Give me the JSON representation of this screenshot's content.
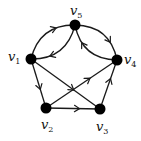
{
  "diagram": {
    "type": "directed-graph",
    "nodes": [
      {
        "id": "v1",
        "label": "v",
        "sub": "1",
        "x": 31,
        "y": 59,
        "lx": 8,
        "ly": 50
      },
      {
        "id": "v2",
        "label": "v",
        "sub": "2",
        "x": 46,
        "y": 108,
        "lx": 41,
        "ly": 118
      },
      {
        "id": "v3",
        "label": "v",
        "sub": "3",
        "x": 100,
        "y": 109,
        "lx": 96,
        "ly": 120
      },
      {
        "id": "v4",
        "label": "v",
        "sub": "4",
        "x": 117,
        "y": 60,
        "lx": 124,
        "ly": 53
      },
      {
        "id": "v5",
        "label": "v",
        "sub": "5",
        "x": 75,
        "y": 25,
        "lx": 70,
        "ly": 4
      }
    ],
    "edges": [
      {
        "from": "v1",
        "to": "v5",
        "curve": "upper"
      },
      {
        "from": "v5",
        "to": "v1",
        "curve": "lower"
      },
      {
        "from": "v5",
        "to": "v4",
        "curve": "upper"
      },
      {
        "from": "v4",
        "to": "v5",
        "curve": "lower"
      },
      {
        "from": "v1",
        "to": "v2",
        "curve": "straight"
      },
      {
        "from": "v1",
        "to": "v3",
        "curve": "straight"
      },
      {
        "from": "v2",
        "to": "v3",
        "curve": "straight"
      },
      {
        "from": "v2",
        "to": "v4",
        "curve": "straight"
      },
      {
        "from": "v3",
        "to": "v4",
        "curve": "straight"
      }
    ],
    "colors": {
      "node": "#000000",
      "edge": "#1a1a1a",
      "background": "#ffffff"
    }
  }
}
